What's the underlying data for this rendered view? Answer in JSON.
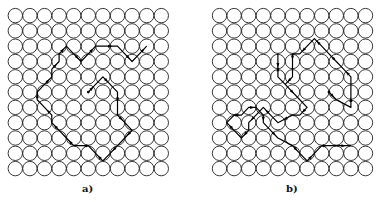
{
  "figure": {
    "panels": [
      {
        "id": "a",
        "label": "a)",
        "grid_cols": 11,
        "grid_rows": 11
      },
      {
        "id": "b",
        "label": "b)",
        "grid_cols": 11,
        "grid_rows": 11
      }
    ],
    "colors": {
      "circle_stroke": "#222222",
      "path_stroke": "#000000",
      "background": "#ffffff"
    }
  }
}
